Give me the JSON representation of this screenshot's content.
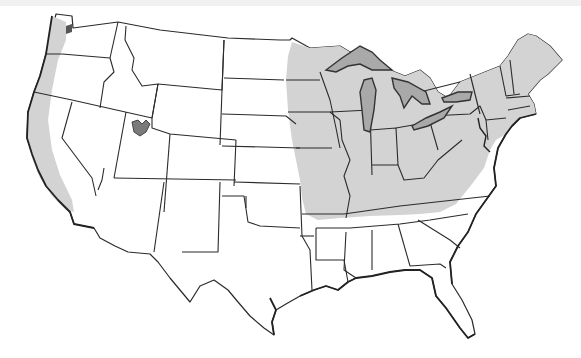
{
  "map": {
    "subject": "Contiguous United States",
    "style": "state outline map, grayscale",
    "colors": {
      "background": "#ffffff",
      "land": "#ffffff",
      "highlight_region": "#d3d3d3",
      "water_body": "#a9a9a9",
      "outline": "#2b2b2b"
    },
    "highlighted_regions": [
      {
        "id": "pacific-coast-strip",
        "label": "Pacific coast strip (WA, OR, CA)"
      },
      {
        "id": "midwest-northeast",
        "label": "Upper Midwest, Ohio Valley and Northeast"
      }
    ],
    "water_features": [
      {
        "id": "great-lakes",
        "label": "Great Lakes"
      },
      {
        "id": "great-salt-lake",
        "label": "Great Salt Lake"
      },
      {
        "id": "puget-sound",
        "label": "Puget Sound"
      }
    ],
    "text_labels": []
  }
}
